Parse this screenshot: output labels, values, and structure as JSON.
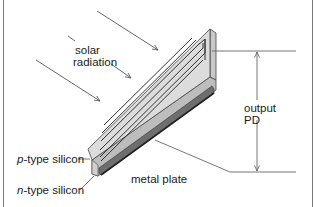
{
  "diagram": {
    "labels": {
      "solar_radiation_line1": "solar",
      "solar_radiation_line2": "radiation",
      "output_line1": "output",
      "output_line2": "PD",
      "p_type_prefix": "p",
      "p_type_suffix": "-type silicon",
      "n_type_prefix": "n",
      "n_type_suffix": "-type silicon",
      "metal_plate": "metal plate"
    },
    "colors": {
      "line": "#555555",
      "panel_top": "#d9d9d9",
      "panel_side": "#bdbdbd",
      "panel_end": "#cfcfcf",
      "grid_line": "#333333",
      "metal_plate": "#6e6e6e",
      "frame": "#777777"
    }
  }
}
